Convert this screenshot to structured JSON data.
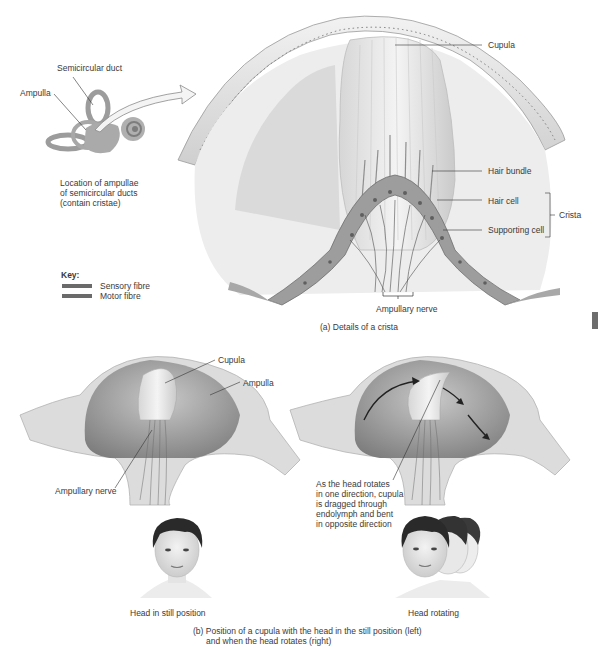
{
  "inset": {
    "labels": {
      "semicircular_duct": "Semicircular duct",
      "ampulla": "Ampulla"
    },
    "caption_lines": [
      "Location of ampullae",
      "of semicircular ducts",
      "(contain cristae)"
    ]
  },
  "key": {
    "title": "Key:",
    "items": [
      {
        "label": "Sensory fibre",
        "color": "#6a6a6a"
      },
      {
        "label": "Motor fibre",
        "color": "#6a6a6a"
      }
    ]
  },
  "panel_a": {
    "labels": {
      "cupula": "Cupula",
      "hair_bundle": "Hair bundle",
      "hair_cell": "Hair cell",
      "supporting_cell": "Supporting cell",
      "crista": "Crista",
      "ampullary_nerve": "Ampullary nerve"
    },
    "caption": "(a) Details of a crista"
  },
  "panel_b": {
    "left": {
      "labels": {
        "cupula": "Cupula",
        "ampulla": "Ampulla",
        "ampullary_nerve": "Ampullary nerve"
      },
      "head_caption": "Head in still position"
    },
    "right": {
      "annotation_lines": [
        "As the head rotates",
        "in one direction, cupula",
        "is dragged through",
        "endolymph and bent",
        "in opposite direction"
      ],
      "head_caption": "Head rotating"
    },
    "caption_lines": [
      "(b) Position of a cupula with the head in the still position (left)",
      "and when the head rotates (right)"
    ]
  },
  "colors": {
    "line": "#333333",
    "tissue_light": "#e6e6e6",
    "tissue_mid": "#bdbdbd",
    "tissue_dark": "#8a8a8a",
    "chamber": "#9a9a9a"
  }
}
